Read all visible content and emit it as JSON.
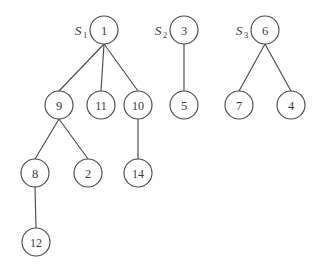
{
  "figure": {
    "type": "forest-of-rooted-trees",
    "background_color": "#ffffff",
    "stroke_color": "#4a4a4a",
    "text_color": "#3a3a3a",
    "node_radius": 14,
    "width": 323,
    "height": 275
  },
  "set_labels": [
    {
      "id": "S1",
      "base": "S",
      "subscript": "1",
      "x": 78,
      "y": 30
    },
    {
      "id": "S2",
      "base": "S",
      "subscript": "2",
      "x": 158,
      "y": 30
    },
    {
      "id": "S3",
      "base": "S",
      "subscript": "3",
      "x": 239,
      "y": 30
    }
  ],
  "nodes": [
    {
      "id": "n1",
      "label": "1",
      "x": 104,
      "y": 30,
      "tree": "S1",
      "depth": 0
    },
    {
      "id": "n9",
      "label": "9",
      "x": 59,
      "y": 105,
      "tree": "S1",
      "depth": 1
    },
    {
      "id": "n11",
      "label": "11",
      "x": 101,
      "y": 105,
      "tree": "S1",
      "depth": 1
    },
    {
      "id": "n10",
      "label": "10",
      "x": 138,
      "y": 105,
      "tree": "S1",
      "depth": 1
    },
    {
      "id": "n8",
      "label": "8",
      "x": 35,
      "y": 173,
      "tree": "S1",
      "depth": 2
    },
    {
      "id": "n2",
      "label": "2",
      "x": 88,
      "y": 173,
      "tree": "S1",
      "depth": 2
    },
    {
      "id": "n14",
      "label": "14",
      "x": 138,
      "y": 173,
      "tree": "S1",
      "depth": 2
    },
    {
      "id": "n12",
      "label": "12",
      "x": 36,
      "y": 242,
      "tree": "S1",
      "depth": 3
    },
    {
      "id": "n3",
      "label": "3",
      "x": 184,
      "y": 30,
      "tree": "S2",
      "depth": 0
    },
    {
      "id": "n5",
      "label": "5",
      "x": 184,
      "y": 105,
      "tree": "S2",
      "depth": 1
    },
    {
      "id": "n6",
      "label": "6",
      "x": 265,
      "y": 30,
      "tree": "S3",
      "depth": 0
    },
    {
      "id": "n7",
      "label": "7",
      "x": 239,
      "y": 105,
      "tree": "S3",
      "depth": 1
    },
    {
      "id": "n4",
      "label": "4",
      "x": 291,
      "y": 105,
      "tree": "S3",
      "depth": 1
    }
  ],
  "edges": [
    {
      "id": "e1",
      "from": "n1",
      "to": "n9",
      "x1": 104,
      "y1": 44,
      "x2": 59,
      "y2": 91
    },
    {
      "id": "e2",
      "from": "n1",
      "to": "n11",
      "x1": 104,
      "y1": 44,
      "x2": 101,
      "y2": 91
    },
    {
      "id": "e3",
      "from": "n1",
      "to": "n10",
      "x1": 104,
      "y1": 44,
      "x2": 138,
      "y2": 91
    },
    {
      "id": "e4",
      "from": "n9",
      "to": "n8",
      "x1": 59,
      "y1": 119,
      "x2": 35,
      "y2": 159
    },
    {
      "id": "e5",
      "from": "n9",
      "to": "n2",
      "x1": 59,
      "y1": 119,
      "x2": 88,
      "y2": 159
    },
    {
      "id": "e6",
      "from": "n10",
      "to": "n14",
      "x1": 138,
      "y1": 119,
      "x2": 138,
      "y2": 159
    },
    {
      "id": "e7",
      "from": "n8",
      "to": "n12",
      "x1": 35,
      "y1": 187,
      "x2": 36,
      "y2": 228
    },
    {
      "id": "e8",
      "from": "n3",
      "to": "n5",
      "x1": 184,
      "y1": 44,
      "x2": 184,
      "y2": 91
    },
    {
      "id": "e9",
      "from": "n6",
      "to": "n7",
      "x1": 265,
      "y1": 44,
      "x2": 239,
      "y2": 91
    },
    {
      "id": "e10",
      "from": "n6",
      "to": "n4",
      "x1": 265,
      "y1": 44,
      "x2": 291,
      "y2": 91
    }
  ]
}
